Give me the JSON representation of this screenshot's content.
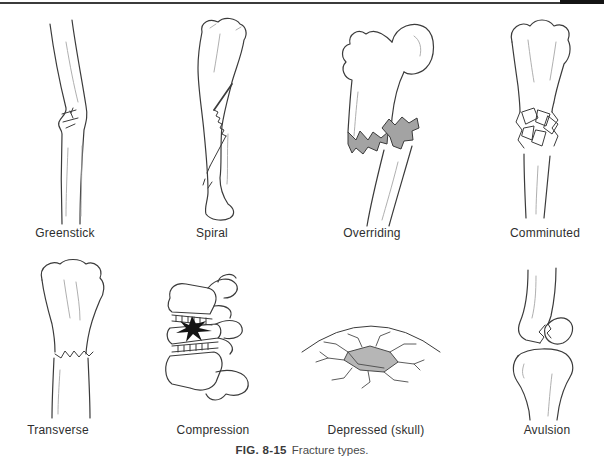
{
  "page": {
    "background": "#ffffff",
    "top_rule": {
      "color": "#3a3a3a",
      "cap_color": "#141414"
    }
  },
  "figure": {
    "caption": {
      "number": "FIG. 8-15",
      "text": "Fracture types."
    },
    "colors": {
      "ink": "#3b3b3b",
      "ink-light": "#a6a6a6",
      "shade": "#a3a3a3",
      "plate": "#b6b6b6",
      "impact": "#141414",
      "label": "#2e2e2e"
    },
    "panels": [
      {
        "id": "greenstick",
        "label": "Greenstick"
      },
      {
        "id": "spiral",
        "label": "Spiral"
      },
      {
        "id": "overriding",
        "label": "Overriding"
      },
      {
        "id": "comminuted",
        "label": "Comminuted"
      },
      {
        "id": "transverse",
        "label": "Transverse"
      },
      {
        "id": "compression",
        "label": "Compression"
      },
      {
        "id": "depressed-skull",
        "label": "Depressed (skull)"
      },
      {
        "id": "avulsion",
        "label": "Avulsion"
      }
    ]
  }
}
